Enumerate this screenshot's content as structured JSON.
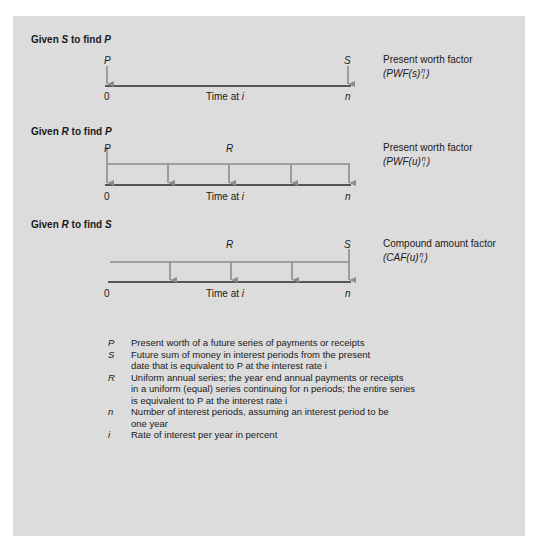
{
  "colors": {
    "panel_background": "#dcdcdc",
    "page_background": "#ffffff",
    "baseline": "#2a2a2a",
    "cash_flow_arrow": "#8c8c8c",
    "text": "#1a1a1a"
  },
  "diagrams": [
    {
      "heading": {
        "prefix": "Given ",
        "given": "S",
        "middle": " to find ",
        "find": "P"
      },
      "top_labels": {
        "left": "P",
        "right": "S"
      },
      "axis": {
        "start": "0",
        "center": "Time at ",
        "center_var": "i",
        "end": "n"
      },
      "factor": {
        "name": "Present worth factor",
        "formula_open": "(PWF(s)",
        "sup": "n",
        "sub": "i",
        "formula_close": ")"
      }
    },
    {
      "heading": {
        "prefix": "Given ",
        "given": "R",
        "middle": " to find ",
        "find": "P"
      },
      "top_labels": {
        "left": "P",
        "middle": "R"
      },
      "axis": {
        "start": "0",
        "center": "Time at ",
        "center_var": "i",
        "end": "n"
      },
      "factor": {
        "name": "Present worth factor",
        "formula_open": "(PWF(u)",
        "sup": "n",
        "sub": "i",
        "formula_close": ")"
      }
    },
    {
      "heading": {
        "prefix": "Given ",
        "given": "R",
        "middle": " to find ",
        "find": "S"
      },
      "top_labels": {
        "middle": "R",
        "right": "S"
      },
      "axis": {
        "start": "0",
        "center": "Time at ",
        "center_var": "i",
        "end": "n"
      },
      "factor": {
        "name": "Compound amount factor",
        "formula_open": "(CAF(u)",
        "sup": "n",
        "sub": "i",
        "formula_close": ")"
      }
    }
  ],
  "legend": [
    {
      "symbol": "P",
      "lines": [
        "Present worth of a future series of payments or receipts"
      ]
    },
    {
      "symbol": "S",
      "lines": [
        "Future sum of money in interest periods from the present",
        "date that is equivalent to P at the interest rate i"
      ]
    },
    {
      "symbol": "R",
      "lines": [
        "Uniform annual series; the year end annual payments or receipts",
        "in a uniform (equal) series continuing for n periods; the entire series",
        "is equivalent to P at the interest rate i"
      ]
    },
    {
      "symbol": "n",
      "lines": [
        "Number of interest periods, assuming an interest period to be",
        "one year"
      ]
    },
    {
      "symbol": "i",
      "lines": [
        "Rate of interest per year in percent"
      ]
    }
  ]
}
